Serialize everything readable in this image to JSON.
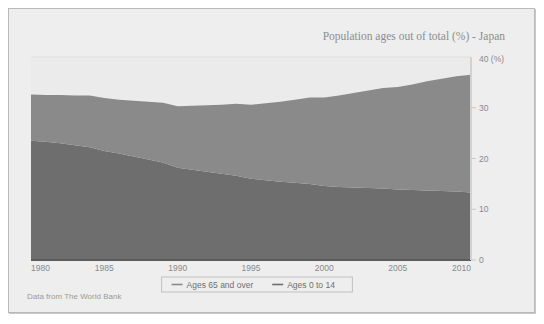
{
  "figure": {
    "background_color": "#ffffff",
    "panel_color": "#eeeeee",
    "plot_background_color": "#ebebeb",
    "border_color": "#b9b9b9"
  },
  "title": "Population ages out of total (%) - Japan",
  "footer": "Data from The World Bank",
  "axis": {
    "y_unit_label": "40 (%)",
    "y_ticks": [
      "0",
      "10",
      "20",
      "30"
    ],
    "x_ticks": [
      "1980",
      "1985",
      "1990",
      "1995",
      "2000",
      "2005",
      "2010"
    ]
  },
  "legend": {
    "items": [
      {
        "label": "Ages 65 and over",
        "color": "#8a8a8a",
        "marker": "line-dash"
      },
      {
        "label": "Ages 0 to 14",
        "color": "#6e6e6e",
        "marker": "line-dash"
      }
    ]
  },
  "chart_data": {
    "type": "area",
    "title": "Population ages out of total (%) - Japan",
    "xlabel": "",
    "ylabel": "40 (%)",
    "xlim": [
      1980,
      2010
    ],
    "ylim": [
      0,
      40
    ],
    "grid": true,
    "stacked": true,
    "legend_position": "bottom",
    "x": [
      1980,
      1981,
      1982,
      1983,
      1984,
      1985,
      1986,
      1987,
      1988,
      1989,
      1990,
      1991,
      1992,
      1993,
      1994,
      1995,
      1996,
      1997,
      1998,
      1999,
      2000,
      2001,
      2002,
      2003,
      2004,
      2005,
      2006,
      2007,
      2008,
      2009,
      2010
    ],
    "series": [
      {
        "name": "Ages 0 to 14",
        "color": "#6e6e6e",
        "values": [
          23.5,
          23.3,
          23.0,
          22.6,
          22.2,
          21.5,
          21.0,
          20.4,
          19.8,
          19.2,
          18.2,
          17.8,
          17.4,
          17.0,
          16.6,
          16.0,
          15.7,
          15.4,
          15.2,
          15.0,
          14.6,
          14.4,
          14.3,
          14.2,
          14.1,
          13.9,
          13.8,
          13.7,
          13.6,
          13.5,
          13.3
        ]
      },
      {
        "name": "Ages 65 and over",
        "color": "#8a8a8a",
        "values": [
          9.1,
          9.2,
          9.5,
          9.8,
          10.2,
          10.4,
          10.6,
          11.0,
          11.4,
          11.8,
          12.1,
          12.6,
          13.1,
          13.6,
          14.2,
          14.6,
          15.2,
          15.8,
          16.4,
          17.0,
          17.4,
          18.0,
          18.6,
          19.2,
          19.8,
          20.2,
          20.8,
          21.5,
          22.1,
          22.7,
          23.2
        ]
      }
    ],
    "totals": [
      32.6,
      32.5,
      32.5,
      32.4,
      32.4,
      31.9,
      31.6,
      31.4,
      31.2,
      31.0,
      30.3,
      30.4,
      30.5,
      30.6,
      30.8,
      30.6,
      30.9,
      31.2,
      31.6,
      32.0,
      32.0,
      32.4,
      32.9,
      33.4,
      33.9,
      34.1,
      34.6,
      35.2,
      35.7,
      36.2,
      36.5
    ]
  }
}
